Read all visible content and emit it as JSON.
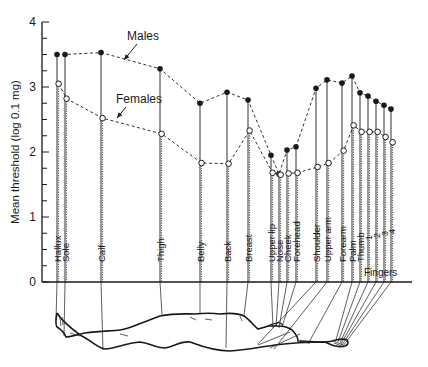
{
  "chart_data": {
    "type": "line",
    "title": "",
    "xlabel": "",
    "ylabel": "Mean threshold (log 0.1 mg)",
    "ylim": [
      0,
      4
    ],
    "yticks": [
      "0",
      "1",
      "2",
      "3",
      "4"
    ],
    "grid": false,
    "categories": [
      "Hallux",
      "Sole",
      "Calf",
      "Thigh",
      "Belly",
      "Back",
      "Breast",
      "Upper lip",
      "Nose",
      "Cheek",
      "Forehead",
      "Shoulder",
      "Upper arm",
      "Forearm",
      "Palm",
      "Thumb",
      "1",
      "2",
      "3",
      "4"
    ],
    "category_group_label": "Fingers",
    "x_positions": [
      57,
      65,
      101,
      160,
      200,
      227,
      248,
      271,
      279,
      287,
      296,
      316,
      327,
      342,
      352,
      360,
      368,
      376,
      384,
      391
    ],
    "series": [
      {
        "name": "Males",
        "marker": "filled-circle",
        "values": [
          3.5,
          3.5,
          3.53,
          3.28,
          2.75,
          2.92,
          2.8,
          1.95,
          1.66,
          2.03,
          2.08,
          2.98,
          3.11,
          3.06,
          3.17,
          2.91,
          2.86,
          2.78,
          2.72,
          2.66
        ]
      },
      {
        "name": "Females",
        "marker": "open-circle",
        "values": [
          3.05,
          2.82,
          2.52,
          2.28,
          1.83,
          1.82,
          2.33,
          1.68,
          1.65,
          1.67,
          1.68,
          1.77,
          1.83,
          2.02,
          2.41,
          2.31,
          2.31,
          2.31,
          2.23,
          2.15
        ]
      }
    ],
    "annotations": [
      {
        "text": "Males",
        "x": 127,
        "y": 40,
        "arrow_to": [
          124,
          60
        ]
      },
      {
        "text": "Females",
        "x": 116,
        "y": 103,
        "arrow_to": [
          117,
          118
        ]
      }
    ],
    "legend_position": "inline-annotations"
  },
  "figure": {
    "body_illustration": "supine human body outline with leader lines to each tested site"
  }
}
